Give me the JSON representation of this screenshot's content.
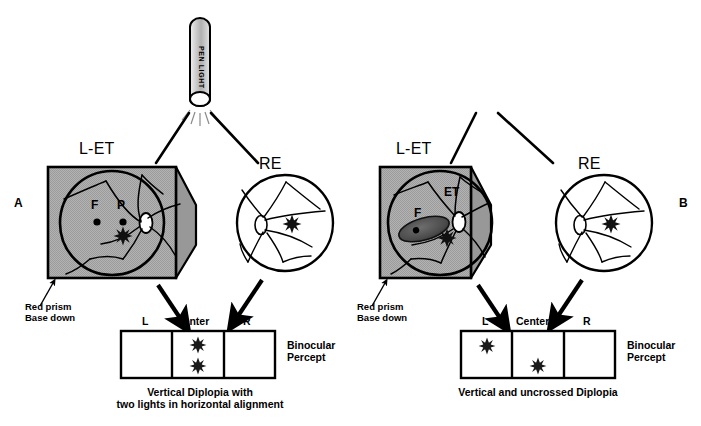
{
  "figure": {
    "type": "clinical-diagram",
    "penlight": {
      "label": "PEN LIGHT"
    },
    "panels": [
      {
        "id": "A",
        "letter": "A",
        "left_eye": {
          "title": "L-ET",
          "prism_note_line1": "Red prism",
          "prism_note_line2": "Base down",
          "fundus_marks": [
            {
              "name": "fovea-label",
              "text": "F"
            },
            {
              "name": "pseudofovea-label",
              "text": "P"
            }
          ],
          "et_label": "",
          "has_scotoma": false
        },
        "right_eye": {
          "title": "RE"
        },
        "percept": {
          "columns": [
            "L",
            "Center",
            "R"
          ],
          "label_line1": "Binocular",
          "label_line2": "Percept",
          "images": [
            {
              "column": "Center",
              "vertical": "upper"
            },
            {
              "column": "Center",
              "vertical": "lower"
            }
          ]
        },
        "caption_line1": "Vertical Diplopia with",
        "caption_line2": "two lights in horizontal alignment"
      },
      {
        "id": "B",
        "letter": "B",
        "left_eye": {
          "title": "L-ET",
          "prism_note_line1": "Red prism",
          "prism_note_line2": "Base down",
          "fundus_marks": [
            {
              "name": "fovea-label",
              "text": "F"
            }
          ],
          "et_label": "ET",
          "has_scotoma": true
        },
        "right_eye": {
          "title": "RE"
        },
        "percept": {
          "columns": [
            "L",
            "Center",
            "R"
          ],
          "label_line1": "Binocular",
          "label_line2": "Percept",
          "images": [
            {
              "column": "L",
              "vertical": "upper"
            },
            {
              "column": "Center",
              "vertical": "lower"
            }
          ]
        },
        "caption_line1": "Vertical and uncrossed Diplopia",
        "caption_line2": ""
      }
    ],
    "colors": {
      "prism_fill": "#a8a8a8",
      "prism_wedge_fill": "#9a9a9a",
      "outline": "#000000",
      "scotoma_fill": "#4a4a4a",
      "paper": "#ffffff"
    }
  }
}
